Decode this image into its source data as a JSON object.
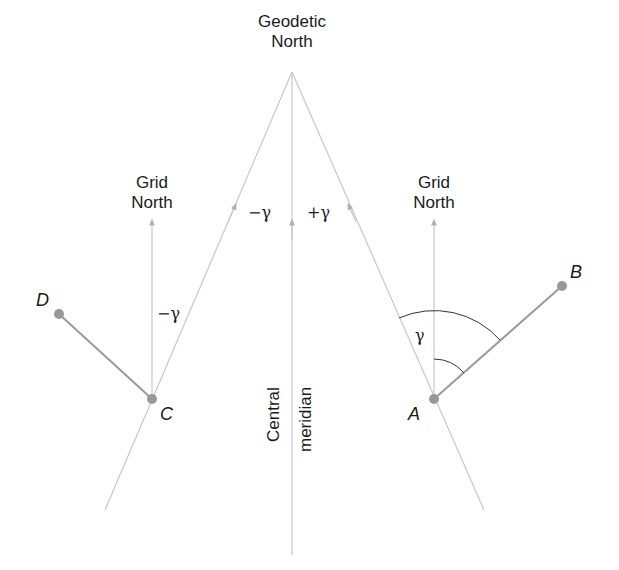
{
  "title_label": {
    "line1": "Geodetic",
    "line2": "North"
  },
  "grid_north_left": {
    "line1": "Grid",
    "line2": "North"
  },
  "grid_north_right": {
    "line1": "Grid",
    "line2": "North"
  },
  "angles": {
    "minus_gamma_top": "−γ",
    "plus_gamma_top": "+γ",
    "minus_gamma_left": "−γ",
    "gamma_right": "γ"
  },
  "central_meridian": {
    "line1": "Central",
    "line2": "meridian"
  },
  "points": {
    "A": "A",
    "B": "B",
    "C": "C",
    "D": "D"
  },
  "colors": {
    "line": "#c8c8c8",
    "segment": "#9a9a9a",
    "point": "#999999",
    "arc": "#333333",
    "text": "#1a1a1a"
  }
}
